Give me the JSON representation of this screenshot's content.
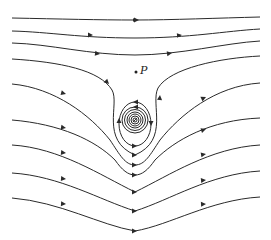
{
  "figure": {
    "stroke_color": "#2a2a2a",
    "point_label": "P",
    "point": {
      "x": 136,
      "y": 72
    },
    "vortex_center": {
      "x": 135,
      "y": 120
    },
    "streamline_count": 10,
    "vortex_ring_count": 6
  }
}
